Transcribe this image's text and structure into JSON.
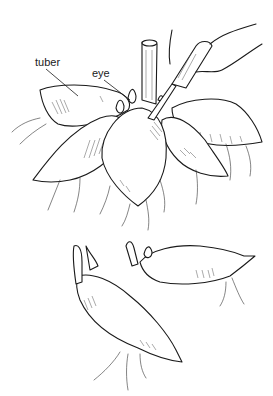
{
  "illustration": {
    "subject": "dividing dahlia tubers",
    "labels": {
      "tuber": "tuber",
      "eye": "eye"
    },
    "colors": {
      "ink": "#1a1a1a",
      "background": "#ffffff"
    }
  }
}
